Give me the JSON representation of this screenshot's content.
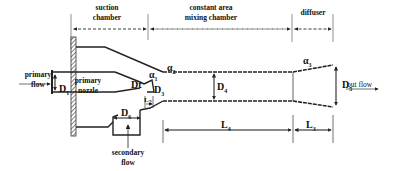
{
  "diagram": {
    "type": "ejector-schematic",
    "sections": [
      {
        "id": "suction",
        "label_line1": "suction",
        "label_line2": "chamber"
      },
      {
        "id": "mixing",
        "label_line1": "constant area",
        "label_line2": "mixing chamber"
      },
      {
        "id": "diffuser",
        "label_line1": "diffuser",
        "label_line2": ""
      }
    ],
    "flows": {
      "primary_line1": "primary",
      "primary_line2": "flow",
      "nozzle_line1": "primary",
      "nozzle_line2": "nozzle",
      "secondary_line1": "secondary",
      "secondary_line2": "flow",
      "out": "out flow"
    },
    "symbols": {
      "D1": {
        "base": "D",
        "sub": "1"
      },
      "Dt": {
        "base": "Dt",
        "sub": ""
      },
      "D3": {
        "base": "D",
        "sub": "3"
      },
      "D4": {
        "base": "D",
        "sub": "4"
      },
      "D5": {
        "base": "D",
        "sub": "5"
      },
      "D6": {
        "base": "D",
        "sub": "6"
      },
      "a1": {
        "base": "α",
        "sub": "1"
      },
      "a2": {
        "base": "α",
        "sub": "2"
      },
      "a3": {
        "base": "α",
        "sub": "3"
      },
      "L2": {
        "base": "L",
        "sub": "2"
      },
      "L4": {
        "base": "L",
        "sub": "4"
      },
      "L3": {
        "base": "L",
        "sub": "3"
      }
    },
    "colors": {
      "line": "#222222",
      "background": "#ffffff"
    }
  }
}
